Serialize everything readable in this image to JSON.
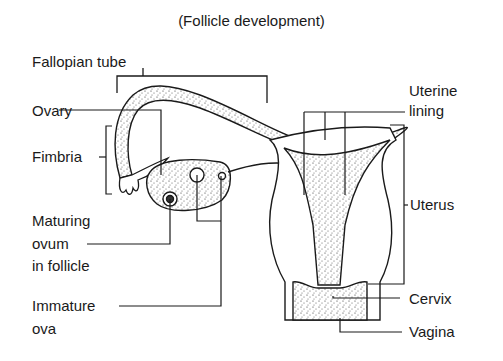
{
  "title": "(Follicle development)",
  "labels": {
    "fallopian_tube": "Fallopian tube",
    "ovary": "Ovary",
    "fimbria": "Fimbria",
    "maturing_ovum_1": "Maturing",
    "maturing_ovum_2": "ovum",
    "maturing_ovum_3": "in follicle",
    "immature_ova_1": "Immature",
    "immature_ova_2": "ova",
    "uterine_lining_1": "Uterine",
    "uterine_lining_2": "lining",
    "uterus": "Uterus",
    "cervix": "Cervix",
    "vagina": "Vagina"
  }
}
